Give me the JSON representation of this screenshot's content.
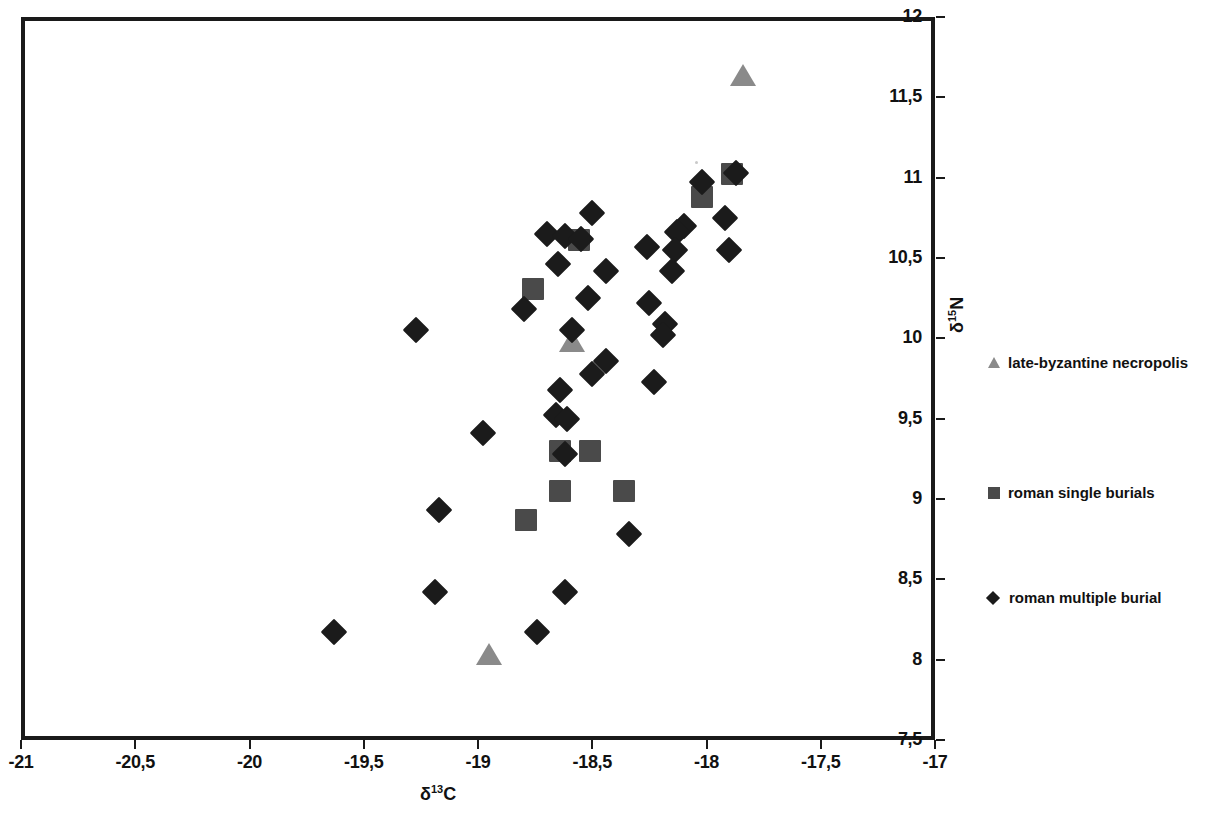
{
  "chart_data": {
    "type": "scatter",
    "title": "",
    "xlabel": "δ13C",
    "ylabel": "δ15N",
    "xlabel_base": "δ",
    "xlabel_sup": "13",
    "xlabel_tail": "C",
    "ylabel_base": "δ",
    "ylabel_sup": "15",
    "ylabel_tail": "N",
    "xlim": [
      -21,
      -17
    ],
    "ylim": [
      7.5,
      12
    ],
    "xticks": [
      -21,
      -20.5,
      -20,
      -19.5,
      -19,
      -18.5,
      -18,
      -17.5,
      -17
    ],
    "xticklabels": [
      "-21",
      "-20,5",
      "-20",
      "-19,5",
      "-19",
      "-18,5",
      "-18",
      "-17,5",
      "-17"
    ],
    "yticks": [
      7.5,
      8,
      8.5,
      9,
      9.5,
      10,
      10.5,
      11,
      11.5,
      12
    ],
    "yticklabels": [
      "7,5",
      "8",
      "8,5",
      "9",
      "9,5",
      "10",
      "10,5",
      "11",
      "11,5",
      "12"
    ],
    "grid": false,
    "yaxis_side": "right",
    "legend_position": "right",
    "decimal_separator": ",",
    "series": [
      {
        "name": "late-byzantine necropolis",
        "marker": "triangle",
        "color": "#8a8a8a",
        "points": [
          {
            "x": -17.84,
            "y": 11.63
          },
          {
            "x": -18.59,
            "y": 9.98
          },
          {
            "x": -18.95,
            "y": 8.03
          }
        ]
      },
      {
        "name": "roman single burials",
        "marker": "square",
        "color": "#4a4a4a",
        "points": [
          {
            "x": -17.89,
            "y": 11.02
          },
          {
            "x": -18.02,
            "y": 10.88
          },
          {
            "x": -18.56,
            "y": 10.61
          },
          {
            "x": -18.76,
            "y": 10.31
          },
          {
            "x": -18.64,
            "y": 9.3
          },
          {
            "x": -18.51,
            "y": 9.3
          },
          {
            "x": -18.64,
            "y": 9.05
          },
          {
            "x": -18.36,
            "y": 9.05
          },
          {
            "x": -18.79,
            "y": 8.87
          }
        ]
      },
      {
        "name": "roman multiple burial",
        "marker": "diamond",
        "color": "#1b1b1b",
        "points": [
          {
            "x": -17.87,
            "y": 11.03
          },
          {
            "x": -18.02,
            "y": 10.97
          },
          {
            "x": -17.92,
            "y": 10.75
          },
          {
            "x": -18.1,
            "y": 10.7
          },
          {
            "x": -18.13,
            "y": 10.66
          },
          {
            "x": -18.5,
            "y": 10.78
          },
          {
            "x": -18.7,
            "y": 10.65
          },
          {
            "x": -18.62,
            "y": 10.64
          },
          {
            "x": -18.55,
            "y": 10.62
          },
          {
            "x": -18.26,
            "y": 10.57
          },
          {
            "x": -17.9,
            "y": 10.55
          },
          {
            "x": -18.14,
            "y": 10.55
          },
          {
            "x": -18.65,
            "y": 10.46
          },
          {
            "x": -18.44,
            "y": 10.42
          },
          {
            "x": -18.15,
            "y": 10.42
          },
          {
            "x": -18.8,
            "y": 10.18
          },
          {
            "x": -18.52,
            "y": 10.25
          },
          {
            "x": -18.25,
            "y": 10.22
          },
          {
            "x": -18.59,
            "y": 10.05
          },
          {
            "x": -18.18,
            "y": 10.09
          },
          {
            "x": -18.19,
            "y": 10.02
          },
          {
            "x": -19.27,
            "y": 10.05
          },
          {
            "x": -18.44,
            "y": 9.86
          },
          {
            "x": -18.23,
            "y": 9.73
          },
          {
            "x": -18.5,
            "y": 9.78
          },
          {
            "x": -18.64,
            "y": 9.68
          },
          {
            "x": -18.66,
            "y": 9.52
          },
          {
            "x": -18.61,
            "y": 9.5
          },
          {
            "x": -18.98,
            "y": 9.41
          },
          {
            "x": -18.62,
            "y": 9.28
          },
          {
            "x": -19.17,
            "y": 8.93
          },
          {
            "x": -18.34,
            "y": 8.78
          },
          {
            "x": -19.19,
            "y": 8.42
          },
          {
            "x": -18.62,
            "y": 8.42
          },
          {
            "x": -19.63,
            "y": 8.17
          },
          {
            "x": -18.74,
            "y": 8.17
          }
        ]
      }
    ]
  },
  "legend": {
    "items": [
      {
        "label": "late-byzantine necropolis",
        "marker": "triangle"
      },
      {
        "label": "roman single burials",
        "marker": "square"
      },
      {
        "label": "roman multiple burial",
        "marker": "diamond"
      }
    ]
  }
}
